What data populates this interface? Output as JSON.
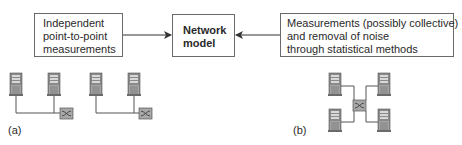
{
  "boxes": {
    "left": {
      "lines": [
        "Independent",
        "point-to-point",
        "measurements"
      ]
    },
    "center": {
      "lines": [
        "Network",
        "model"
      ]
    },
    "right": {
      "lines": [
        "Measurements (possibly collective)",
        "and removal of noise",
        "through statistical methods"
      ]
    }
  },
  "panels": {
    "a": {
      "label": "(a)",
      "topology": "two separate pairs of servers, each pair connected via a switch"
    },
    "b": {
      "label": "(b)",
      "topology": "four servers connected through a single central switch"
    }
  },
  "arrows": [
    {
      "from": "left",
      "to": "center"
    },
    {
      "from": "right",
      "to": "center"
    }
  ],
  "colors": {
    "border": "#6a6a6a",
    "server": "#7a7a7a",
    "switch": "#9a9a9a",
    "line": "#555555"
  }
}
